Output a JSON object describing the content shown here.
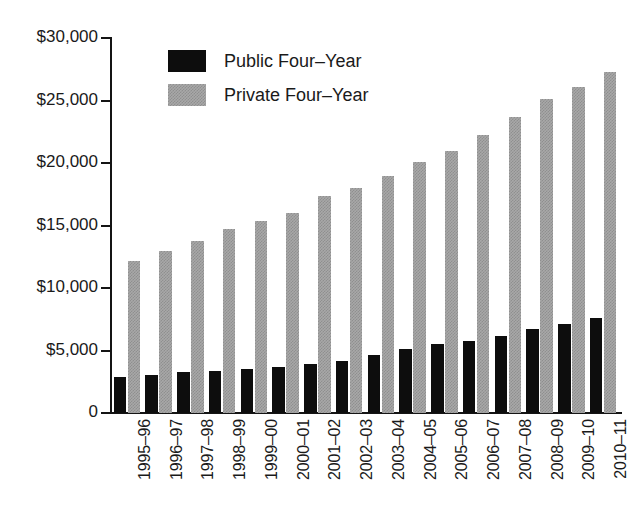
{
  "chart_data": {
    "type": "bar",
    "title": "",
    "xlabel": "",
    "ylabel": "",
    "ylim": [
      0,
      30000
    ],
    "grid": false,
    "legend_position": "top-left",
    "categories": [
      "1995–96",
      "1996–97",
      "1997–98",
      "1998–99",
      "1999–00",
      "2000–01",
      "2001–02",
      "2002–03",
      "2003–04",
      "2004–05",
      "2005–06",
      "2006–07",
      "2007–08",
      "2008–09",
      "2009–10",
      "2010–11"
    ],
    "y_ticks": [
      0,
      5000,
      10000,
      15000,
      20000,
      25000,
      30000
    ],
    "y_tick_labels": [
      "0",
      "$5,000",
      "$10,000",
      "$15,000",
      "$20,000",
      "$25,000",
      "$30,000"
    ],
    "series": [
      {
        "name": "Public Four–Year",
        "color": "#0d0d0d",
        "values": [
          2850,
          3050,
          3250,
          3400,
          3500,
          3650,
          3900,
          4200,
          4650,
          5150,
          5500,
          5800,
          6200,
          6700,
          7100,
          7600
        ]
      },
      {
        "name": "Private Four–Year",
        "color": "#a8a8a8",
        "values": [
          12200,
          13000,
          13800,
          14700,
          15400,
          16000,
          17400,
          18000,
          18950,
          20100,
          21000,
          22250,
          23700,
          25100,
          26100,
          27300
        ]
      }
    ]
  },
  "legend": {
    "items": [
      {
        "label": "Public Four–Year",
        "swatch": "black-swatch"
      },
      {
        "label": "Private Four–Year",
        "swatch": "gray-swatch"
      }
    ]
  },
  "axis": {
    "y_labels": [
      "$30,000",
      "$25,000",
      "$20,000",
      "$15,000",
      "$10,000",
      "$5,000",
      "0"
    ]
  }
}
